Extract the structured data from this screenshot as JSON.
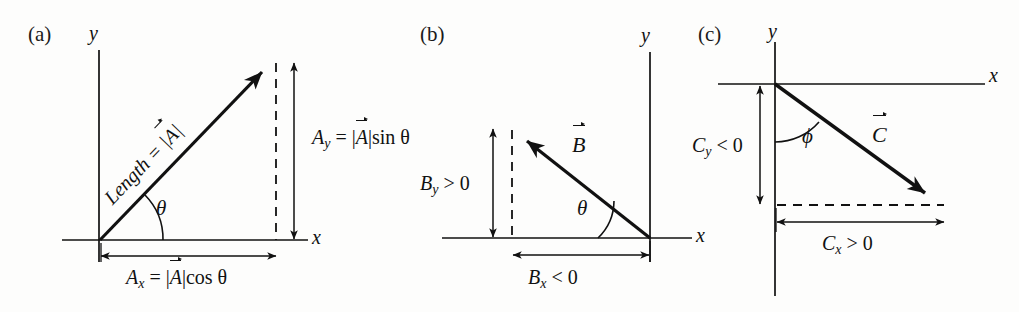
{
  "figure": {
    "caption_present": false,
    "background_color": "#fdfdfc",
    "ink_color": "#111111"
  },
  "panels": [
    {
      "id": "a",
      "label": "(a)",
      "axis_x_label": "x",
      "axis_y_label": "y",
      "vector_name": "A",
      "length_label_prefix": "Length = |",
      "length_label_vec": "A",
      "length_label_suffix": "|",
      "angle_symbol": "θ",
      "y_component_label_lhs": "A",
      "y_component_label_sub": "y",
      "y_component_label_rhs_pre": " = |",
      "y_component_label_vec": "A",
      "y_component_label_rhs_post": "|sin θ",
      "x_component_label_lhs": "A",
      "x_component_label_sub": "x",
      "x_component_label_rhs_pre": " = |",
      "x_component_label_vec": "A",
      "x_component_label_rhs_post": "|cos θ"
    },
    {
      "id": "b",
      "label": "(b)",
      "axis_x_label": "x",
      "axis_y_label": "y",
      "vector_name": "B",
      "angle_symbol": "θ",
      "y_component_label_lhs": "B",
      "y_component_label_sub": "y",
      "y_component_label_rhs": " > 0",
      "x_component_label_lhs": "B",
      "x_component_label_sub": "x",
      "x_component_label_rhs": " < 0"
    },
    {
      "id": "c",
      "label": "(c)",
      "axis_x_label": "x",
      "axis_y_label": "y",
      "vector_name": "C",
      "angle_symbol": "ϕ",
      "y_component_label_lhs": "C",
      "y_component_label_sub": "y",
      "y_component_label_rhs": " < 0",
      "x_component_label_lhs": "C",
      "x_component_label_sub": "x",
      "x_component_label_rhs": " > 0"
    }
  ]
}
